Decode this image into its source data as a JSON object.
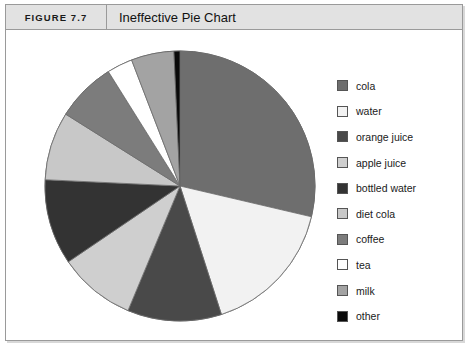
{
  "figure": {
    "number": "FIGURE 7.7",
    "title": "Ineffective Pie Chart"
  },
  "colors": {
    "frame_border": "#9a9a9a",
    "header_background": "#e2e2e2",
    "page_background": "#ffffff",
    "slice_outline": "#6b6b6b"
  },
  "legend": {
    "items": [
      {
        "label": "cola",
        "color": "#6e6e6e"
      },
      {
        "label": "water",
        "color": "#f2f2f2"
      },
      {
        "label": "orange juice",
        "color": "#494949"
      },
      {
        "label": "apple juice",
        "color": "#cfcfcf"
      },
      {
        "label": "bottled water",
        "color": "#333333"
      },
      {
        "label": "diet cola",
        "color": "#c8c8c8"
      },
      {
        "label": "coffee",
        "color": "#7c7c7c"
      },
      {
        "label": "tea",
        "color": "#ffffff"
      },
      {
        "label": "milk",
        "color": "#a3a3a3"
      },
      {
        "label": "other",
        "color": "#0a0a0a"
      }
    ]
  },
  "chart_data": {
    "type": "pie",
    "title": "Ineffective Pie Chart",
    "xlabel": "",
    "ylabel": "",
    "legend_position": "right",
    "start_angle_deg": 0,
    "direction": "clockwise",
    "categories": [
      "cola",
      "water",
      "orange juice",
      "apple juice",
      "bottled water",
      "diet cola",
      "coffee",
      "tea",
      "milk",
      "other"
    ],
    "values": [
      28.0,
      16.0,
      11.0,
      9.0,
      10.0,
      8.0,
      7.0,
      3.0,
      5.0,
      0.7
    ],
    "units": "percent",
    "colors": [
      "#6e6e6e",
      "#f2f2f2",
      "#494949",
      "#cfcfcf",
      "#333333",
      "#c8c8c8",
      "#7c7c7c",
      "#ffffff",
      "#a3a3a3",
      "#0a0a0a"
    ],
    "center": {
      "x": 140,
      "y": 140
    },
    "radius": 135
  }
}
